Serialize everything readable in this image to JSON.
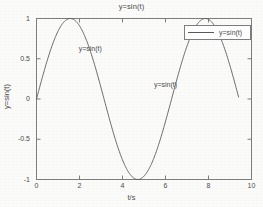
{
  "chart_data": {
    "type": "line",
    "title": "y=sin(t)",
    "xlabel": "t/s",
    "ylabel": "y=sin(t)",
    "xlim": [
      0,
      10
    ],
    "ylim": [
      -1,
      1
    ],
    "xticks": [
      "0",
      "2",
      "4",
      "6",
      "8",
      "10"
    ],
    "xtick_values": [
      0,
      2,
      4,
      6,
      8,
      10
    ],
    "yticks": [
      "-1",
      "-0.5",
      "0",
      "0.5",
      "1"
    ],
    "ytick_values": [
      -1,
      -0.5,
      0,
      0.5,
      1
    ],
    "grid": false,
    "legend_position": "upper right",
    "series": [
      {
        "name": "y=sin(t)",
        "color": "#5a5a5a",
        "x_start": 0,
        "x_end": 9.4,
        "formula": "sin(t)",
        "values": [
          {
            "t": 0.0,
            "y": 0.0
          },
          {
            "t": 0.5,
            "y": 0.479
          },
          {
            "t": 1.0,
            "y": 0.841
          },
          {
            "t": 1.5708,
            "y": 1.0
          },
          {
            "t": 2.0,
            "y": 0.909
          },
          {
            "t": 2.5,
            "y": 0.599
          },
          {
            "t": 3.0,
            "y": 0.141
          },
          {
            "t": 3.1416,
            "y": 0.0
          },
          {
            "t": 3.5,
            "y": -0.351
          },
          {
            "t": 4.0,
            "y": -0.757
          },
          {
            "t": 4.7124,
            "y": -1.0
          },
          {
            "t": 5.0,
            "y": -0.959
          },
          {
            "t": 5.5,
            "y": -0.706
          },
          {
            "t": 6.0,
            "y": -0.279
          },
          {
            "t": 6.2832,
            "y": 0.0
          },
          {
            "t": 6.5,
            "y": 0.215
          },
          {
            "t": 7.0,
            "y": 0.657
          },
          {
            "t": 7.5,
            "y": 0.938
          },
          {
            "t": 7.854,
            "y": 1.0
          },
          {
            "t": 8.0,
            "y": 0.989
          },
          {
            "t": 8.5,
            "y": 0.798
          },
          {
            "t": 9.0,
            "y": 0.412
          },
          {
            "t": 9.4,
            "y": 0.012
          }
        ]
      }
    ],
    "annotations": [
      {
        "text": "y=sin(t)",
        "t": 2.8,
        "y": 0.62
      },
      {
        "text": "y=sin(t)",
        "t": 6.3,
        "y": 0.18
      }
    ],
    "legend": [
      {
        "label": "y=sin(t)",
        "color": "#5a5a5a"
      }
    ]
  },
  "colors": {
    "line": "#5a5a5a",
    "axis": "#7d7d7d",
    "text": "#4a4a4a",
    "background": "#fbfbfa"
  }
}
